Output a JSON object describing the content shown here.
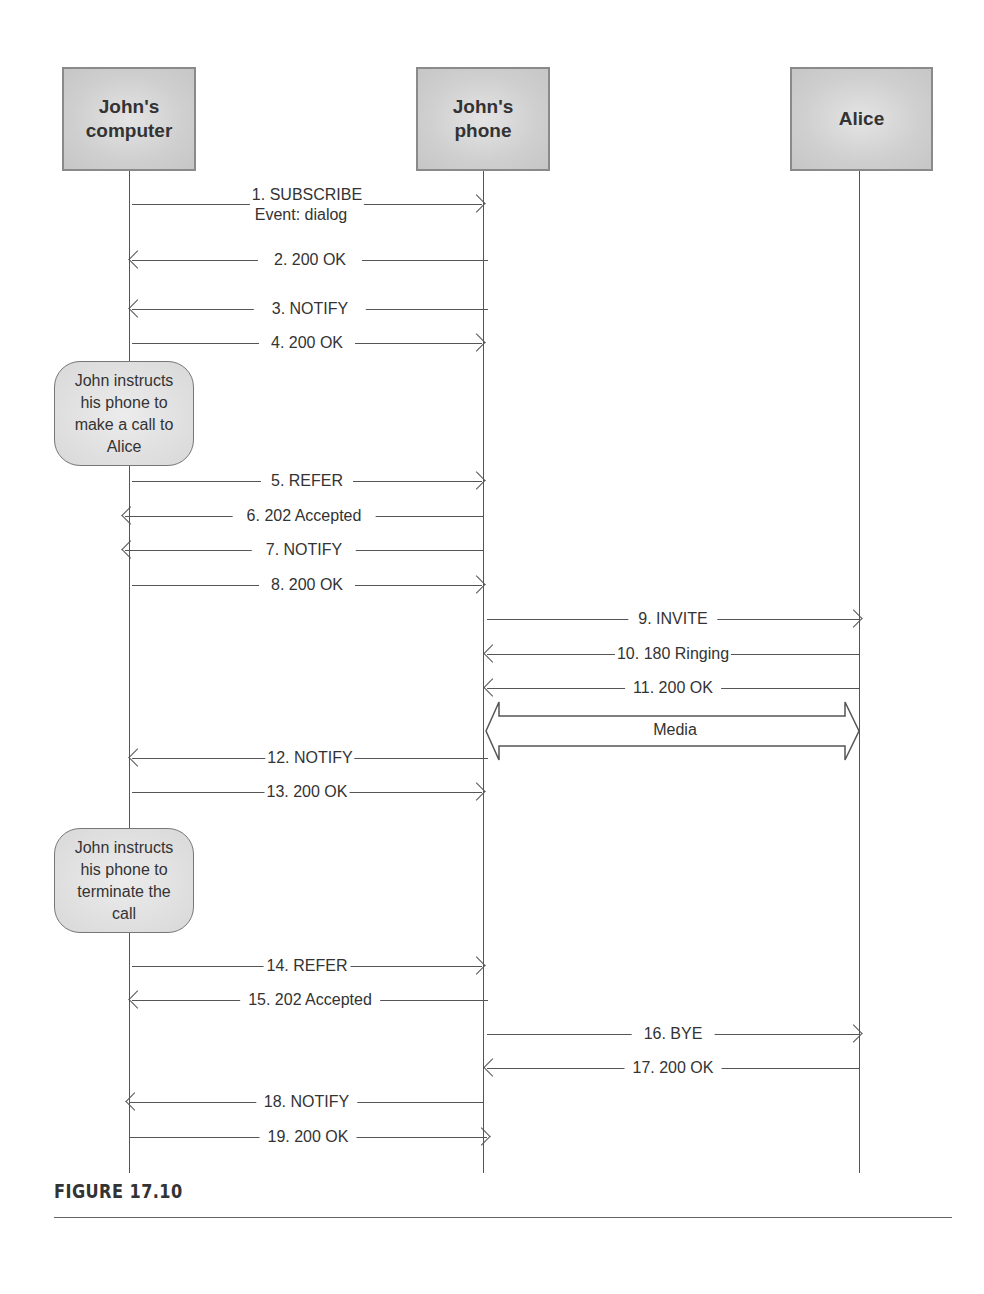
{
  "actors": [
    {
      "id": "computer",
      "label": "John's computer",
      "line1": "John's",
      "line2": "computer"
    },
    {
      "id": "phone",
      "label": "John's phone",
      "line1": "John's",
      "line2": "phone"
    },
    {
      "id": "alice",
      "label": "Alice",
      "line1": "Alice",
      "line2": ""
    }
  ],
  "messages": [
    {
      "n": 1,
      "label": "1. SUBSCRIBE",
      "sublabel": "Event: dialog",
      "from": "computer",
      "to": "phone"
    },
    {
      "n": 2,
      "label": "2. 200 OK",
      "from": "phone",
      "to": "computer"
    },
    {
      "n": 3,
      "label": "3. NOTIFY",
      "from": "phone",
      "to": "computer"
    },
    {
      "n": 4,
      "label": "4. 200 OK",
      "from": "computer",
      "to": "phone"
    },
    {
      "n": 5,
      "label": "5. REFER",
      "from": "computer",
      "to": "phone"
    },
    {
      "n": 6,
      "label": "6. 202 Accepted",
      "from": "phone",
      "to": "computer"
    },
    {
      "n": 7,
      "label": "7. NOTIFY",
      "from": "phone",
      "to": "computer"
    },
    {
      "n": 8,
      "label": "8. 200 OK",
      "from": "computer",
      "to": "phone"
    },
    {
      "n": 9,
      "label": "9. INVITE",
      "from": "phone",
      "to": "alice"
    },
    {
      "n": 10,
      "label": "10. 180 Ringing",
      "from": "alice",
      "to": "phone"
    },
    {
      "n": 11,
      "label": "11. 200 OK",
      "from": "alice",
      "to": "phone"
    },
    {
      "n": 12,
      "label": "12. NOTIFY",
      "from": "phone",
      "to": "computer"
    },
    {
      "n": 13,
      "label": "13. 200 OK",
      "from": "computer",
      "to": "phone"
    },
    {
      "n": 14,
      "label": "14. REFER",
      "from": "computer",
      "to": "phone"
    },
    {
      "n": 15,
      "label": "15. 202 Accepted",
      "from": "phone",
      "to": "computer"
    },
    {
      "n": 16,
      "label": "16. BYE",
      "from": "phone",
      "to": "alice"
    },
    {
      "n": 17,
      "label": "17. 200 OK",
      "from": "alice",
      "to": "phone"
    },
    {
      "n": 18,
      "label": "18. NOTIFY",
      "from": "phone",
      "to": "computer"
    },
    {
      "n": 19,
      "label": "19. 200 OK",
      "from": "computer",
      "to": "phone"
    }
  ],
  "media": {
    "label": "Media",
    "between": [
      "phone",
      "alice"
    ]
  },
  "notes": [
    {
      "text": "John instructs his phone to make a call to Alice",
      "lines": [
        "John instructs",
        "his phone to",
        "make a call to",
        "Alice"
      ]
    },
    {
      "text": "John instructs his phone to terminate the call",
      "lines": [
        "John instructs",
        "his phone to",
        "terminate the",
        "call"
      ]
    }
  ],
  "caption": "FIGURE 17.10"
}
